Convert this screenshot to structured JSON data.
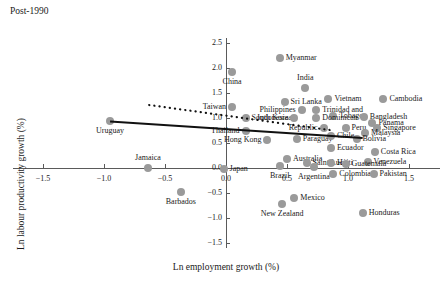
{
  "panel": {
    "title": "Post-1990"
  },
  "chart_data": {
    "type": "scatter",
    "title": "Post-1990",
    "xlabel": "Ln employment growth (%)",
    "ylabel": "Ln labour productivity growth (%)",
    "xlim": [
      -1.75,
      1.75
    ],
    "ylim": [
      -1.6,
      2.6
    ],
    "xticks": [
      -1.5,
      -1.0,
      -0.5,
      0.0,
      0.5,
      1.0,
      1.5
    ],
    "xticklabels": [
      "−1.5",
      "−1.0",
      "−0.5",
      "0.0",
      "0.5",
      "1.0",
      "1.5"
    ],
    "yticks": [
      -1.5,
      -1.0,
      -0.5,
      0.0,
      0.5,
      1.0,
      1.5,
      2.0,
      2.5
    ],
    "yticklabels": [
      "−1.5",
      "−1.0",
      "−0.5",
      "0.0",
      "0.5",
      "1.0",
      "1.5",
      "2.0",
      "2.5"
    ],
    "grid": false,
    "legend": "none",
    "marker_color": "#9a9a9a",
    "axis_color": "#5a5a5a",
    "points": [
      {
        "label": "Myanmar",
        "x": 0.44,
        "y": 2.2,
        "lp": "right"
      },
      {
        "label": "China",
        "x": 0.05,
        "y": 1.92,
        "lp": "below"
      },
      {
        "label": "India",
        "x": 0.65,
        "y": 1.6,
        "lp": "above"
      },
      {
        "label": "Vietnam",
        "x": 0.84,
        "y": 1.38,
        "lp": "right"
      },
      {
        "label": "Cambodia",
        "x": 1.29,
        "y": 1.38,
        "lp": "right"
      },
      {
        "label": "Sri Lanka",
        "x": 0.48,
        "y": 1.32,
        "lp": "right"
      },
      {
        "label": "Taiwan",
        "x": 0.05,
        "y": 1.22,
        "lp": "left"
      },
      {
        "label": "Philippines",
        "x": 0.62,
        "y": 1.16,
        "lp": "left"
      },
      {
        "label": "Trinidad and",
        "x": 0.74,
        "y": 1.16,
        "lp": "right"
      },
      {
        "label": "Tobago",
        "x": 0.88,
        "y": 1.04,
        "lp": "right"
      },
      {
        "label": "Bangladesh",
        "x": 1.13,
        "y": 1.02,
        "lp": "right"
      },
      {
        "label": "South Korea",
        "x": 0.16,
        "y": 1.0,
        "lp": "right"
      },
      {
        "label": "Indonesia",
        "x": 0.56,
        "y": 1.0,
        "lp": "left"
      },
      {
        "label": "Dominican",
        "x": 0.74,
        "y": 1.0,
        "lp": "right"
      },
      {
        "label": "Panama",
        "x": 1.2,
        "y": 0.9,
        "lp": "right"
      },
      {
        "label": "Republic",
        "x": 0.8,
        "y": 0.8,
        "lp": "left"
      },
      {
        "label": "Peru",
        "x": 0.98,
        "y": 0.8,
        "lp": "right"
      },
      {
        "label": "Singapore",
        "x": 1.24,
        "y": 0.8,
        "lp": "right"
      },
      {
        "label": "Malaysia",
        "x": 1.14,
        "y": 0.7,
        "lp": "right"
      },
      {
        "label": "Thailand",
        "x": 0.16,
        "y": 0.74,
        "lp": "left"
      },
      {
        "label": "Hong Kong",
        "x": 0.34,
        "y": 0.56,
        "lp": "left"
      },
      {
        "label": "Uruguay",
        "x": -0.95,
        "y": 0.94,
        "lp": "below"
      },
      {
        "label": "Paraguay",
        "x": 0.58,
        "y": 0.58,
        "lp": "right"
      },
      {
        "label": "Chile",
        "x": 0.86,
        "y": 0.64,
        "lp": "right"
      },
      {
        "label": "Bolivia",
        "x": 1.07,
        "y": 0.58,
        "lp": "right"
      },
      {
        "label": "Ecuador",
        "x": 0.86,
        "y": 0.4,
        "lp": "right"
      },
      {
        "label": "Costa Rica",
        "x": 1.22,
        "y": 0.32,
        "lp": "right"
      },
      {
        "label": "Australia",
        "x": 0.5,
        "y": 0.18,
        "lp": "right"
      },
      {
        "label": "Saint Lucia",
        "x": 0.66,
        "y": 0.1,
        "lp": "right"
      },
      {
        "label": "Haiti",
        "x": 0.86,
        "y": 0.1,
        "lp": "right"
      },
      {
        "label": "Venezuela",
        "x": 1.16,
        "y": 0.12,
        "lp": "right"
      },
      {
        "label": "Brazil",
        "x": 0.44,
        "y": 0.04,
        "lp": "below"
      },
      {
        "label": "Argentina",
        "x": 0.72,
        "y": 0.02,
        "lp": "below"
      },
      {
        "label": "Guatemala",
        "x": 0.98,
        "y": 0.08,
        "lp": "right"
      },
      {
        "label": "Colombia",
        "x": 0.88,
        "y": -0.12,
        "lp": "right"
      },
      {
        "label": "Pakistan",
        "x": 1.21,
        "y": -0.12,
        "lp": "right"
      },
      {
        "label": "Jamaica",
        "x": -0.64,
        "y": 0.0,
        "lp": "above"
      },
      {
        "label": "Japan",
        "x": -0.02,
        "y": -0.02,
        "lp": "right"
      },
      {
        "label": "Barbados",
        "x": -0.37,
        "y": -0.48,
        "lp": "below"
      },
      {
        "label": "Mexico",
        "x": 0.56,
        "y": -0.6,
        "lp": "right"
      },
      {
        "label": "New Zealand",
        "x": 0.46,
        "y": -0.72,
        "lp": "below"
      },
      {
        "label": "Honduras",
        "x": 1.12,
        "y": -0.9,
        "lp": "right"
      }
    ],
    "trend_lines": [
      {
        "name": "solid-fit",
        "style": "solid",
        "x0": -0.95,
        "y0": 0.93,
        "x1": 1.12,
        "y1": 0.6
      },
      {
        "name": "dotted-fit",
        "style": "dotted",
        "x0": -0.63,
        "y0": 1.26,
        "x1": 0.88,
        "y1": 0.75
      }
    ]
  }
}
